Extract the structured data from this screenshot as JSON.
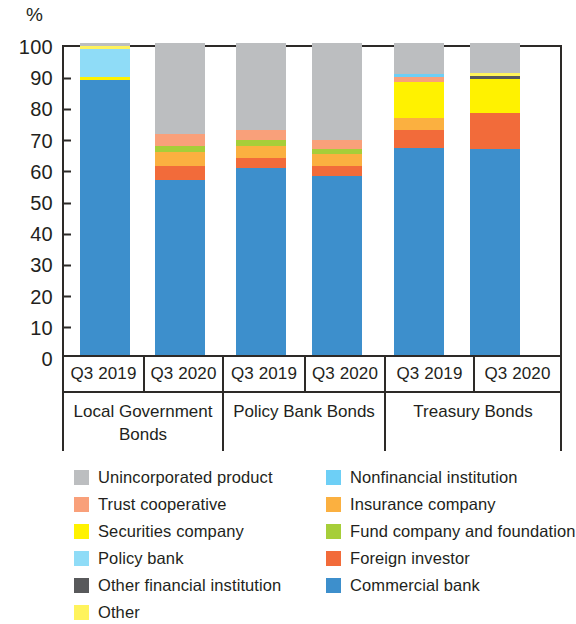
{
  "chart_data": {
    "type": "bar",
    "subtype": "stacked-percentage",
    "title": "",
    "xlabel": "",
    "ylabel": "%",
    "ylim": [
      0,
      100
    ],
    "yticks": [
      100,
      90,
      80,
      70,
      60,
      50,
      40,
      30,
      20,
      10,
      0
    ],
    "grid": false,
    "legend_position": "bottom",
    "groups": [
      {
        "name": "Local Government Bonds",
        "periods": [
          "Q3 2019",
          "Q3 2020"
        ]
      },
      {
        "name": "Policy Bank Bonds",
        "periods": [
          "Q3 2019",
          "Q3 2020"
        ]
      },
      {
        "name": "Treasury Bonds",
        "periods": [
          "Q3 2019",
          "Q3 2020"
        ]
      }
    ],
    "categories": [
      "Local Government Bonds Q3 2019",
      "Local Government Bonds Q3 2020",
      "Policy Bank Bonds Q3 2019",
      "Policy Bank Bonds Q3 2020",
      "Treasury Bonds Q3 2019",
      "Treasury Bonds Q3 2020"
    ],
    "series": [
      {
        "name": "Commercial bank",
        "color": "#3d8fcc",
        "values": [
          88.0,
          56.0,
          60.0,
          57.5,
          66.5,
          66.0
        ]
      },
      {
        "name": "Foreign investor",
        "color": "#f26b3a",
        "values": [
          0.0,
          4.5,
          3.0,
          3.0,
          5.5,
          11.5
        ]
      },
      {
        "name": "Insurance company",
        "color": "#fbb040",
        "values": [
          0.0,
          4.5,
          4.0,
          4.0,
          4.0,
          0.0
        ]
      },
      {
        "name": "Fund company and foundation",
        "color": "#a6ce39",
        "values": [
          0.0,
          2.0,
          2.0,
          1.5,
          0.0,
          0.0
        ]
      },
      {
        "name": "Securities company",
        "color": "#fff200",
        "values": [
          1.0,
          0.0,
          0.0,
          0.0,
          11.5,
          11.0
        ]
      },
      {
        "name": "Other financial institution",
        "color": "#58595b",
        "values": [
          0.0,
          0.0,
          0.0,
          0.0,
          0.0,
          1.0
        ]
      },
      {
        "name": "Trust cooperative",
        "color": "#f9a07a",
        "values": [
          0.0,
          4.0,
          3.0,
          3.0,
          1.5,
          0.0
        ]
      },
      {
        "name": "Nonfinancial institution",
        "color": "#6dcff6",
        "values": [
          0.0,
          0.0,
          0.0,
          0.0,
          1.0,
          0.0
        ]
      },
      {
        "name": "Policy bank",
        "color": "#8fdcf7",
        "values": [
          9.0,
          0.0,
          0.0,
          0.0,
          0.0,
          0.0
        ]
      },
      {
        "name": "Other",
        "color": "#fff35c",
        "values": [
          1.0,
          0.0,
          0.0,
          0.0,
          0.0,
          1.0
        ]
      },
      {
        "name": "Unincorporated product",
        "color": "#bcbec0",
        "values": [
          1.0,
          29.0,
          28.0,
          31.0,
          10.0,
          9.5
        ]
      }
    ],
    "stack_order_bottom_to_top": [
      "Commercial bank",
      "Foreign investor",
      "Insurance company",
      "Fund company and foundation",
      "Securities company",
      "Other financial institution",
      "Trust cooperative",
      "Nonfinancial institution",
      "Policy bank",
      "Other",
      "Unincorporated product"
    ]
  },
  "axis": {
    "unit": "%"
  },
  "legend": {
    "left_column": [
      {
        "label": "Unincorporated product",
        "color": "#bcbec0"
      },
      {
        "label": "Trust cooperative",
        "color": "#f9a07a"
      },
      {
        "label": "Securities company",
        "color": "#fff200"
      },
      {
        "label": "Policy bank",
        "color": "#8fdcf7"
      },
      {
        "label": "Other financial institution",
        "color": "#58595b"
      },
      {
        "label": "Other",
        "color": "#fff35c"
      }
    ],
    "right_column": [
      {
        "label": "Nonfinancial institution",
        "color": "#6dcff6"
      },
      {
        "label": "Insurance company",
        "color": "#fbb040"
      },
      {
        "label": "Fund company and foundation",
        "color": "#a6ce39"
      },
      {
        "label": "Foreign investor",
        "color": "#f26b3a"
      },
      {
        "label": "Commercial bank",
        "color": "#3d8fcc"
      }
    ]
  }
}
